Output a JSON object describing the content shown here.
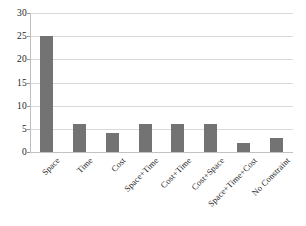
{
  "chart_data": {
    "type": "bar",
    "title": "",
    "subtitle": "",
    "xlabel": "",
    "ylabel": "",
    "categories": [
      "Space",
      "Time",
      "Cost",
      "Space+Time",
      "Cost+Time",
      "Cost+Space",
      "Space+Time+Cost",
      "No Constraint"
    ],
    "values": [
      25,
      6,
      4,
      6,
      6,
      6,
      2,
      3
    ],
    "ylim": [
      0,
      30
    ],
    "y_ticks": [
      0,
      5,
      10,
      15,
      20,
      25,
      30
    ],
    "y_tick_labels": [
      "0",
      "5",
      "10",
      "15",
      "20",
      "25",
      "30"
    ],
    "grid": "horizontal",
    "legend": "none",
    "series": [
      {
        "name": "series-1",
        "color": "#737373",
        "values": [
          25,
          6,
          4,
          6,
          6,
          6,
          2,
          3
        ]
      }
    ],
    "annotations": []
  },
  "style": {
    "bar_color": "#737373",
    "grid_color": "#d9d9d9",
    "axis_color": "#bfbfbf",
    "text_color": "#1c1c1c",
    "background": "#ffffff"
  }
}
